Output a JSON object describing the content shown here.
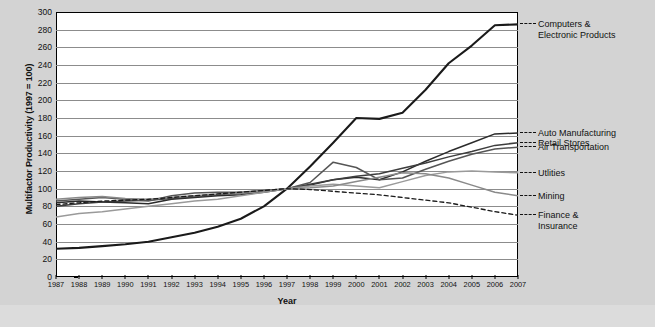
{
  "chart_data": {
    "type": "line",
    "title": "",
    "xlabel": "Year",
    "ylabel": "Multifactor Productivity (1997 = 100)",
    "ylim": [
      0,
      300
    ],
    "ytick_step": 20,
    "grid": true,
    "legend_position": "right",
    "base_year": 1997,
    "base_value": 100,
    "x": [
      1987,
      1988,
      1989,
      1990,
      1991,
      1992,
      1993,
      1994,
      1995,
      1996,
      1997,
      1998,
      1999,
      2000,
      2001,
      2002,
      2003,
      2004,
      2005,
      2006,
      2007
    ],
    "xtick_labels": [
      "1987",
      "1988",
      "1989",
      "1990",
      "1991",
      "1992",
      "1993",
      "1994",
      "1995",
      "1996",
      "1997",
      "1998",
      "1999",
      "2000",
      "2001",
      "2002",
      "2003",
      "2004",
      "2005",
      "2006",
      "2007"
    ],
    "ytick_labels": [
      "0",
      "20",
      "40",
      "60",
      "80",
      "100",
      "120",
      "140",
      "160",
      "180",
      "200",
      "220",
      "240",
      "260",
      "280",
      "300"
    ],
    "series": [
      {
        "name": "Computers & Electronic Products",
        "label": "Computers &\nElectronic Products",
        "color": "#1a1a1a",
        "width": 2.1,
        "dashed": false,
        "values": [
          32,
          33,
          35,
          37,
          40,
          45,
          50,
          57,
          66,
          80,
          100,
          125,
          152,
          180,
          179,
          186,
          212,
          242,
          262,
          285,
          286
        ]
      },
      {
        "name": "Auto Manufacturing",
        "label": "Auto Manufacturing",
        "color": "#2b2b2b",
        "width": 1.5,
        "dashed": false,
        "values": [
          84,
          86,
          85,
          84,
          83,
          88,
          90,
          92,
          93,
          96,
          100,
          104,
          110,
          113,
          110,
          119,
          131,
          142,
          152,
          162,
          163
        ]
      },
      {
        "name": "Retail Stores",
        "label": "Retail Stores",
        "color": "#3d3d3d",
        "width": 1.5,
        "dashed": false,
        "values": [
          80,
          83,
          85,
          86,
          87,
          89,
          91,
          93,
          95,
          97,
          100,
          105,
          110,
          114,
          117,
          123,
          129,
          136,
          142,
          149,
          152
        ]
      },
      {
        "name": "Air Transportation",
        "label": "Air Transportation",
        "color": "#555555",
        "width": 1.5,
        "dashed": false,
        "values": [
          86,
          88,
          90,
          88,
          86,
          92,
          95,
          96,
          96,
          98,
          100,
          107,
          130,
          124,
          110,
          112,
          122,
          131,
          139,
          145,
          147
        ]
      },
      {
        "name": "Utlities",
        "label": "Utlities",
        "color": "#9a9a9a",
        "width": 1.5,
        "dashed": false,
        "values": [
          68,
          72,
          74,
          77,
          80,
          83,
          86,
          88,
          92,
          96,
          100,
          103,
          105,
          103,
          101,
          108,
          115,
          119,
          120,
          119,
          118
        ]
      },
      {
        "name": "Mining",
        "label": "Mining",
        "color": "#8a8a8a",
        "width": 1.5,
        "dashed": false,
        "values": [
          88,
          90,
          91,
          89,
          88,
          90,
          92,
          94,
          95,
          97,
          100,
          101,
          103,
          108,
          113,
          118,
          117,
          112,
          104,
          96,
          92
        ]
      },
      {
        "name": "Finance & Insurance",
        "label": "Finance &\nInsurance",
        "color": "#1a1a1a",
        "width": 1.3,
        "dashed": true,
        "values": [
          82,
          84,
          86,
          87,
          88,
          90,
          92,
          94,
          96,
          98,
          100,
          99,
          97,
          95,
          93,
          90,
          87,
          84,
          79,
          74,
          70
        ]
      }
    ],
    "legend_entries": [
      {
        "label": "Computers &\nElectronic Products",
        "value_at_end": 286,
        "dashed": true
      },
      {
        "label": "Auto Manufacturing",
        "value_at_end": 163,
        "dashed": true
      },
      {
        "label": "Retail Stores",
        "value_at_end": 152,
        "dashed": true
      },
      {
        "label": "Air Transportation",
        "value_at_end": 147,
        "dashed": true
      },
      {
        "label": "Utlities",
        "value_at_end": 118,
        "dashed": true
      },
      {
        "label": "Mining",
        "value_at_end": 92,
        "dashed": true
      },
      {
        "label": "Finance &\nInsurance",
        "value_at_end": 70,
        "dashed": true
      }
    ]
  }
}
